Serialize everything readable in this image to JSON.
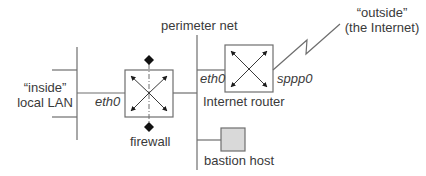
{
  "diagram": {
    "labels": {
      "inside_line1": "“inside”",
      "inside_line2": "local LAN",
      "firewall_eth0": "eth0",
      "firewall": "firewall",
      "perimeter_net": "perimeter net",
      "router_eth0": "eth0",
      "router_sppp0": "sppp0",
      "internet_router": "Internet router",
      "outside_line1": "“outside”",
      "outside_line2": "(the Internet)",
      "bastion_host": "bastion host"
    },
    "nodes": [
      {
        "id": "local-lan",
        "type": "network-segment",
        "label": "“inside” local LAN"
      },
      {
        "id": "firewall",
        "type": "router-box",
        "label": "firewall",
        "interface": "eth0"
      },
      {
        "id": "perimeter-net",
        "type": "network-segment",
        "label": "perimeter net"
      },
      {
        "id": "internet-router",
        "type": "router-box",
        "label": "Internet router",
        "interfaces": [
          "eth0",
          "sppp0"
        ]
      },
      {
        "id": "bastion-host",
        "type": "host",
        "label": "bastion host"
      },
      {
        "id": "internet",
        "type": "external",
        "label": "“outside” (the Internet)"
      }
    ],
    "edges": [
      {
        "from": "local-lan",
        "to": "firewall",
        "label": "eth0"
      },
      {
        "from": "firewall",
        "to": "perimeter-net"
      },
      {
        "from": "perimeter-net",
        "to": "internet-router",
        "label": "eth0"
      },
      {
        "from": "perimeter-net",
        "to": "bastion-host"
      },
      {
        "from": "internet-router",
        "to": "internet",
        "label": "sppp0",
        "style": "lightning"
      }
    ],
    "colors": {
      "line": "#6e6e6e",
      "box_border": "#6e6e6e",
      "bastion_fill": "#d9d9d9",
      "text": "#3a3a3a",
      "arrow": "#1a1a1a"
    }
  }
}
